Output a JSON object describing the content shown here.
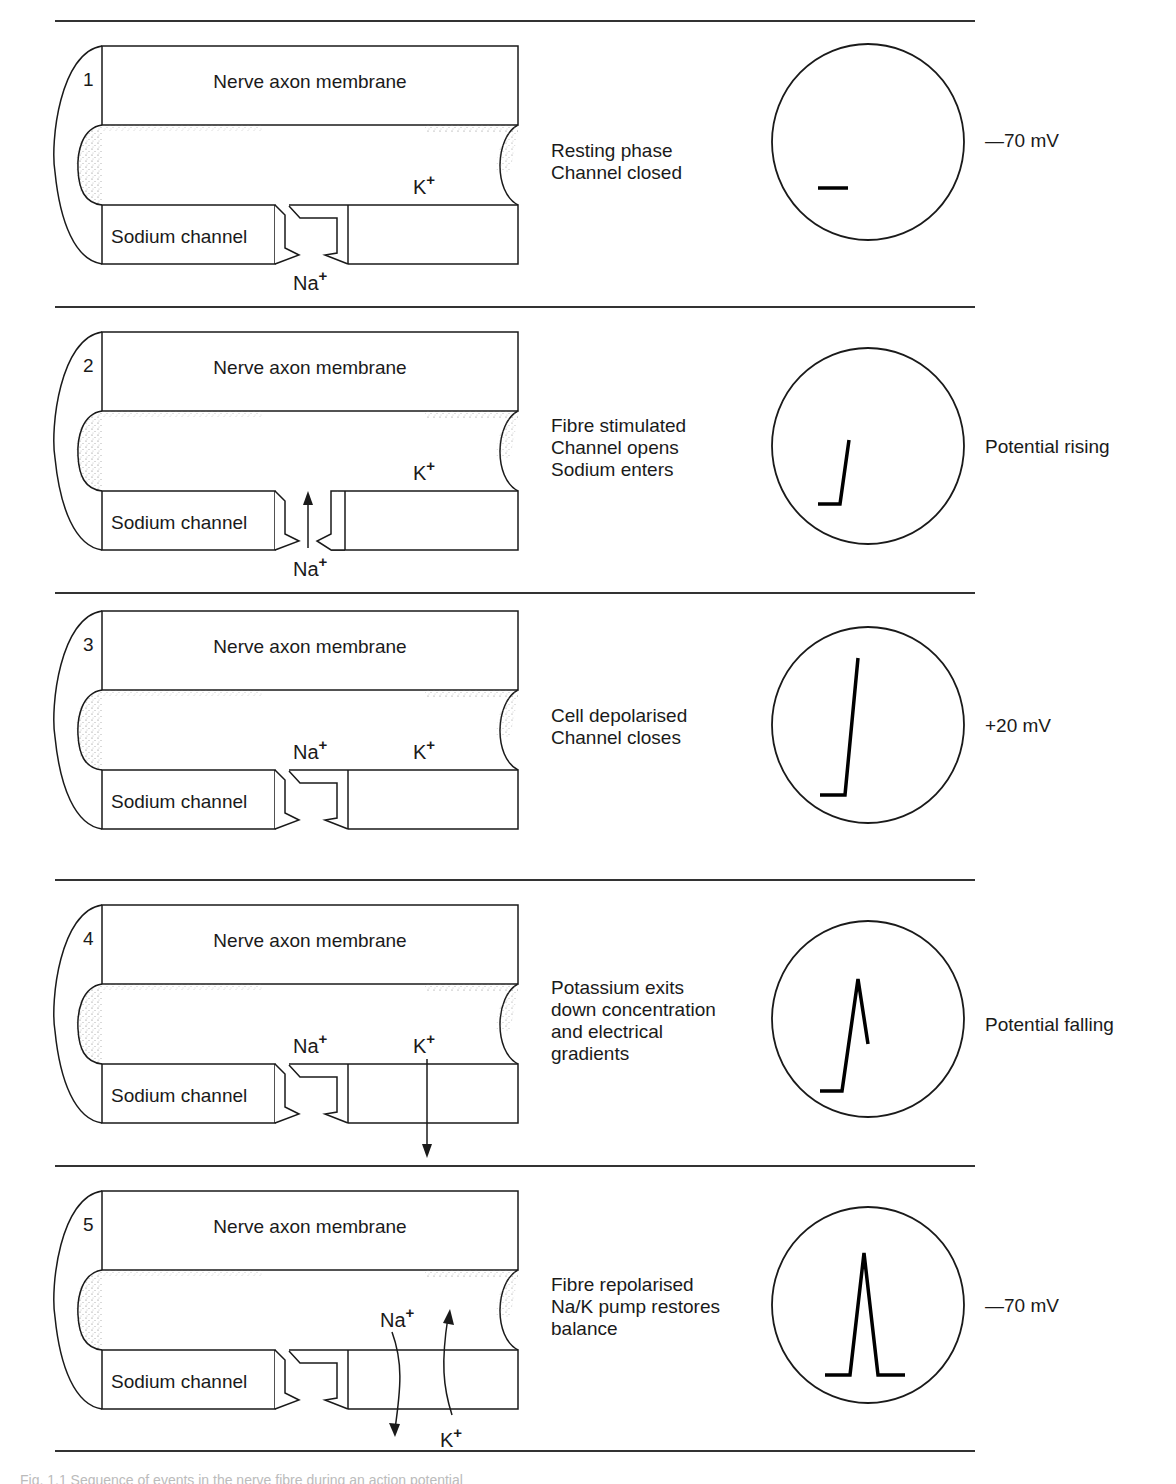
{
  "figure": {
    "type": "Nerve impulse / action potential sequence",
    "common_labels": {
      "membrane": "Nerve axon membrane",
      "channel": "Sodium channel",
      "sodium_ion": "Na",
      "potassium_ion": "K",
      "charge": "+"
    },
    "panels": [
      {
        "number": "1",
        "description": "Resting phase\nChannel closed",
        "channel_state": "closed",
        "na_label_position": "outside",
        "k_arrow": "none",
        "oscilloscope_trace": "baseline",
        "reading": "—70 mV"
      },
      {
        "number": "2",
        "description": "Fibre stimulated\nChannel opens\nSodium enters",
        "channel_state": "open",
        "na_label_position": "outside-entering",
        "k_arrow": "none",
        "oscilloscope_trace": "rising",
        "reading": "Potential rising"
      },
      {
        "number": "3",
        "description": "Cell depolarised\nChannel closes",
        "channel_state": "closed",
        "na_label_position": "inside",
        "k_arrow": "none",
        "oscilloscope_trace": "peak",
        "reading": "+20 mV"
      },
      {
        "number": "4",
        "description": "Potassium exits\ndown concentration\nand electrical\ngradients",
        "channel_state": "closed",
        "na_label_position": "inside",
        "k_arrow": "exit",
        "oscilloscope_trace": "falling",
        "reading": "Potential falling"
      },
      {
        "number": "5",
        "description": "Fibre repolarised\nNa/K pump restores\nbalance",
        "channel_state": "closed",
        "na_label_position": "pump",
        "k_arrow": "pump",
        "oscilloscope_trace": "full-spike",
        "reading": "—70 mV"
      }
    ]
  },
  "caption": "Fig. 1.1  Sequence of events in the nerve fibre during an action potential"
}
